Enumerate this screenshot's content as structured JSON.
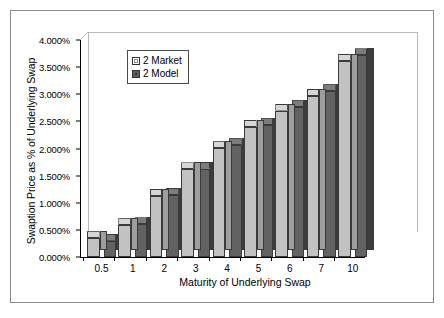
{
  "chart_data": {
    "type": "bar",
    "title": "",
    "xlabel": "Maturity of Underlying Swap",
    "ylabel": "Swaption Price as % of Underlying Swap",
    "categories": [
      "0.5",
      "1",
      "2",
      "3",
      "4",
      "5",
      "6",
      "7",
      "10"
    ],
    "series": [
      {
        "name": "2 Market",
        "color": "#c2c2c2",
        "values": [
          0.345,
          0.585,
          1.125,
          1.615,
          2.005,
          2.395,
          2.7,
          2.97,
          3.615
        ]
      },
      {
        "name": "2 Model",
        "color": "#626262",
        "values": [
          0.3,
          0.6,
          1.145,
          1.63,
          2.06,
          2.43,
          2.76,
          3.055,
          3.715
        ]
      }
    ],
    "ylim": [
      0,
      4
    ],
    "ytick_step": 0.5,
    "ytick_labels": [
      "0.000%",
      "0.500%",
      "1.000%",
      "1.500%",
      "2.000%",
      "2.500%",
      "3.000%",
      "3.500%",
      "4.000%"
    ],
    "ytick_values": [
      0,
      0.5,
      1,
      1.5,
      2,
      2.5,
      3,
      3.5,
      4
    ],
    "grid": false,
    "legend_position": "upper-left",
    "value_unit": "%",
    "style": "3d-clustered-column"
  },
  "legend": {
    "entries": [
      {
        "label": "2 Market",
        "swatch": "market"
      },
      {
        "label": "2 Model",
        "swatch": "model"
      }
    ]
  }
}
